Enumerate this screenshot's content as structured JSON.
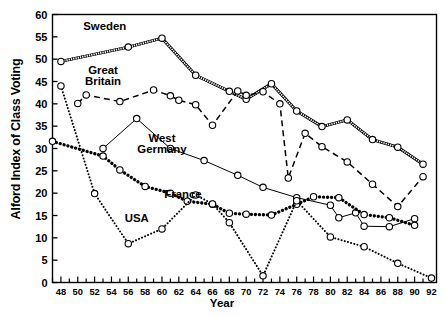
{
  "chart_data": {
    "type": "line",
    "title": "",
    "xlabel": "Year",
    "ylabel": "Alford Index of Class Voting",
    "xlim": [
      1947,
      1992.6
    ],
    "ylim": [
      0,
      60
    ],
    "yticks": [
      0,
      5,
      10,
      15,
      20,
      25,
      30,
      35,
      40,
      45,
      50,
      55,
      60
    ],
    "ytick_labels": [
      "0",
      "5",
      "10",
      "15",
      "20",
      "25",
      "30",
      "35",
      "40",
      "45",
      "50",
      "55",
      "60"
    ],
    "xticks": [
      1948,
      1950,
      1952,
      1954,
      1956,
      1958,
      1960,
      1962,
      1964,
      1966,
      1968,
      1970,
      1972,
      1974,
      1976,
      1978,
      1980,
      1982,
      1984,
      1986,
      1988,
      1990,
      1992
    ],
    "xtick_labels": [
      "48",
      "50",
      "52",
      "54",
      "56",
      "58",
      "60",
      "62",
      "64",
      "66",
      "68",
      "70",
      "72",
      "74",
      "76",
      "78",
      "80",
      "82",
      "84",
      "86",
      "88",
      "90",
      "92"
    ],
    "minor_xtick_interval": 1,
    "grid": false,
    "legend": "inline-annotations",
    "marker": "open-circle",
    "series": [
      {
        "name": "Sweden",
        "style": "hatched-double",
        "color": "#000000",
        "label_x": 1953.2,
        "label_y": 56.6,
        "points": [
          {
            "x": 1948,
            "y": 49.5
          },
          {
            "x": 1956,
            "y": 52.7
          },
          {
            "x": 1960,
            "y": 54.7
          },
          {
            "x": 1964,
            "y": 46.4
          },
          {
            "x": 1968,
            "y": 42.8
          },
          {
            "x": 1970,
            "y": 41.0
          },
          {
            "x": 1973,
            "y": 44.5
          },
          {
            "x": 1976,
            "y": 38.4
          },
          {
            "x": 1979,
            "y": 34.9
          },
          {
            "x": 1982,
            "y": 36.4
          },
          {
            "x": 1985,
            "y": 32.0
          },
          {
            "x": 1988,
            "y": 30.3
          },
          {
            "x": 1991,
            "y": 26.5
          }
        ]
      },
      {
        "name": "Great Britain",
        "style": "long-dash",
        "color": "#000000",
        "label_x": 1953.0,
        "label_y": 46.6,
        "label_line2": true,
        "points": [
          {
            "x": 1950,
            "y": 40.1
          },
          {
            "x": 1951,
            "y": 42.0
          },
          {
            "x": 1955,
            "y": 40.5
          },
          {
            "x": 1959,
            "y": 43.1
          },
          {
            "x": 1961,
            "y": 41.8
          },
          {
            "x": 1962,
            "y": 40.8
          },
          {
            "x": 1964,
            "y": 39.8
          },
          {
            "x": 1966,
            "y": 35.2
          },
          {
            "x": 1969,
            "y": 42.9
          },
          {
            "x": 1970,
            "y": 41.9
          },
          {
            "x": 1972,
            "y": 42.7
          },
          {
            "x": 1974,
            "y": 40.0
          },
          {
            "x": 1975,
            "y": 23.4
          },
          {
            "x": 1977,
            "y": 33.4
          },
          {
            "x": 1979,
            "y": 30.4
          },
          {
            "x": 1982,
            "y": 27.0
          },
          {
            "x": 1985,
            "y": 22.0
          },
          {
            "x": 1988,
            "y": 17.0
          },
          {
            "x": 1991,
            "y": 23.7
          }
        ]
      },
      {
        "name": "West Germany",
        "style": "thin-solid",
        "color": "#000000",
        "label_x": 1960.0,
        "label_y": 31.5,
        "label_line2": true,
        "points": [
          {
            "x": 1953,
            "y": 30.0
          },
          {
            "x": 1957,
            "y": 36.7
          },
          {
            "x": 1961,
            "y": 30.0
          },
          {
            "x": 1965,
            "y": 27.3
          },
          {
            "x": 1969,
            "y": 24.0
          },
          {
            "x": 1972,
            "y": 21.3
          },
          {
            "x": 1976,
            "y": 19.0
          },
          {
            "x": 1980,
            "y": 17.3
          },
          {
            "x": 1981,
            "y": 14.5
          },
          {
            "x": 1983,
            "y": 15.6
          },
          {
            "x": 1984,
            "y": 12.6
          },
          {
            "x": 1987,
            "y": 12.5
          },
          {
            "x": 1990,
            "y": 14.3
          }
        ]
      },
      {
        "name": "France",
        "style": "thick-dot",
        "color": "#000000",
        "label_x": 1962.5,
        "label_y": 19.0,
        "points": [
          {
            "x": 1947,
            "y": 31.6
          },
          {
            "x": 1953,
            "y": 28.3
          },
          {
            "x": 1955,
            "y": 25.2
          },
          {
            "x": 1958,
            "y": 21.5
          },
          {
            "x": 1961,
            "y": 20.0
          },
          {
            "x": 1963,
            "y": 18.2
          },
          {
            "x": 1966,
            "y": 17.5
          },
          {
            "x": 1968,
            "y": 15.5
          },
          {
            "x": 1970,
            "y": 15.3
          },
          {
            "x": 1973,
            "y": 15.1
          },
          {
            "x": 1976,
            "y": 17.5
          },
          {
            "x": 1978,
            "y": 19.2
          },
          {
            "x": 1981,
            "y": 19.0
          },
          {
            "x": 1984,
            "y": 15.2
          },
          {
            "x": 1987,
            "y": 14.5
          },
          {
            "x": 1990,
            "y": 12.8
          }
        ]
      },
      {
        "name": "USA",
        "style": "fine-dot",
        "color": "#000000",
        "label_x": 1957.0,
        "label_y": 13.5,
        "points": [
          {
            "x": 1948,
            "y": 44.0
          },
          {
            "x": 1952,
            "y": 19.9
          },
          {
            "x": 1956,
            "y": 8.7
          },
          {
            "x": 1960,
            "y": 12.0
          },
          {
            "x": 1964,
            "y": 19.6
          },
          {
            "x": 1966,
            "y": 17.6
          },
          {
            "x": 1968,
            "y": 13.4
          },
          {
            "x": 1972,
            "y": 1.5
          },
          {
            "x": 1976,
            "y": 18.3
          },
          {
            "x": 1980,
            "y": 10.2
          },
          {
            "x": 1984,
            "y": 8.0
          },
          {
            "x": 1988,
            "y": 4.3
          },
          {
            "x": 1992,
            "y": 1.0
          }
        ]
      }
    ]
  },
  "axis": {
    "ylabel": "Alford Index of Class Voting",
    "xlabel": "Year"
  },
  "labels": {
    "sweden": "Sweden",
    "great": "Great",
    "britain": "Britain",
    "west": "West",
    "germany": "Germany",
    "france": "France",
    "usa": "USA"
  }
}
